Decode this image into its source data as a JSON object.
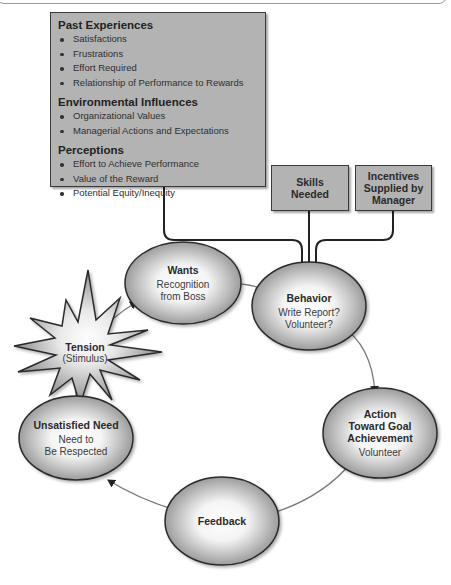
{
  "panel": {
    "sections": [
      {
        "title": "Past Experiences",
        "items": [
          "Satisfactions",
          "Frustrations",
          "Effort Required",
          "Relationship of Performance to Rewards"
        ]
      },
      {
        "title": "Environmental Influences",
        "items": [
          "Organizational Values",
          "Managerial Actions and Expectations"
        ]
      },
      {
        "title": "Perceptions",
        "items": [
          "Effort to Achieve Performance",
          "Value of the Reward",
          "Potential Equity/Inequity"
        ]
      }
    ]
  },
  "boxes": {
    "skills": {
      "line1": "Skills",
      "line2": "Needed"
    },
    "incentives": {
      "line1": "Incentives",
      "line2": "Supplied by",
      "line3": "Manager"
    }
  },
  "nodes": {
    "wants": {
      "title": "Wants",
      "sub1": "Recognition",
      "sub2": "from Boss"
    },
    "behavior": {
      "title": "Behavior",
      "sub1": "Write Report?",
      "sub2": "Volunteer?"
    },
    "action": {
      "title1": "Action",
      "title2": "Toward Goal",
      "title3": "Achievement",
      "sub1": "Volunteer"
    },
    "feedback": {
      "title": "Feedback"
    },
    "unsatisfied": {
      "title": "Unsatisfied Need",
      "sub1": "Need to",
      "sub2": "Be Respected"
    },
    "tension": {
      "title": "Tension",
      "sub1": "(Stimulus)"
    }
  },
  "colors": {
    "box_fill": "#b3b3b3",
    "ellipse_edge": "#9c9c9c",
    "outline": "#2a2a2a",
    "arrow": "#707070"
  }
}
